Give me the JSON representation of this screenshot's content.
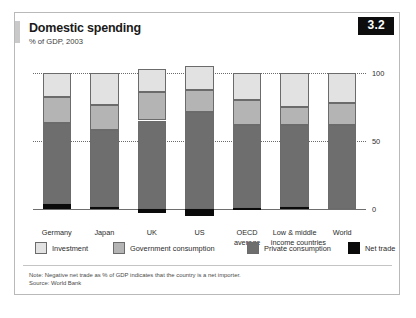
{
  "figure": {
    "number": "3.2",
    "title": "Domestic spending",
    "subtitle": "% of GDP, 2003",
    "note": "Note: Negative net trade as % of GDP indicates that the country is a net importer.",
    "source": "Source: World Bank"
  },
  "legend": [
    {
      "label": "Investment",
      "key": "investment",
      "color": "#e2e2e2"
    },
    {
      "label": "Government consumption",
      "key": "government",
      "color": "#b4b4b4"
    },
    {
      "label": "Private consumption",
      "key": "private",
      "color": "#6e6e6e"
    },
    {
      "label": "Net trade",
      "key": "nettrade",
      "color": "#0a0a0a"
    }
  ],
  "chart_data": {
    "type": "bar",
    "stacked": true,
    "title": "Domestic spending",
    "subtitle": "% of GDP, 2003",
    "xlabel": "",
    "ylabel": "% of GDP",
    "ylim": [
      -10,
      110
    ],
    "yticks": [
      0,
      50,
      100
    ],
    "ytick_labels": [
      "0",
      "50",
      "100"
    ],
    "grid": "horizontal-dotted",
    "legend_position": "below-plot",
    "categories": [
      "Germany",
      "Japan",
      "UK",
      "US",
      "OECD average",
      "Low & middle income countries",
      "World"
    ],
    "category_lines": [
      [
        "Germany"
      ],
      [
        "Japan"
      ],
      [
        "UK"
      ],
      [
        "US"
      ],
      [
        "OECD",
        "average"
      ],
      [
        "Low & middle",
        "income countries"
      ],
      [
        "World"
      ]
    ],
    "stack_order_bottom_to_top": [
      "nettrade",
      "private",
      "government",
      "investment"
    ],
    "series": [
      {
        "name": "Net trade",
        "key": "nettrade",
        "values": [
          4,
          2,
          -3,
          -5,
          1,
          2,
          0
        ]
      },
      {
        "name": "Private consumption",
        "key": "private",
        "values": [
          59,
          56,
          65,
          71,
          61,
          60,
          62
        ]
      },
      {
        "name": "Government consumption",
        "key": "government",
        "values": [
          19,
          18,
          21,
          16,
          18,
          13,
          16
        ]
      },
      {
        "name": "Investment",
        "key": "investment",
        "values": [
          18,
          24,
          17,
          18,
          20,
          25,
          22
        ]
      }
    ],
    "totals": [
      100,
      100,
      100,
      100,
      100,
      100,
      100
    ]
  }
}
